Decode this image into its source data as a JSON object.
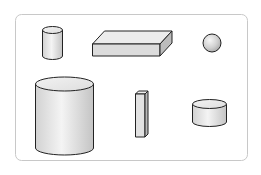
{
  "figure": {
    "frame_stroke": "#c8c8c8",
    "shape_stroke": "#222222",
    "shapes": [
      {
        "id": "small-cylinder",
        "type": "cylinder"
      },
      {
        "id": "flat-box",
        "type": "rectangular-prism"
      },
      {
        "id": "sphere",
        "type": "sphere"
      },
      {
        "id": "large-cylinder",
        "type": "cylinder"
      },
      {
        "id": "tall-prism",
        "type": "rectangular-prism"
      },
      {
        "id": "short-cylinder",
        "type": "cylinder"
      }
    ]
  }
}
